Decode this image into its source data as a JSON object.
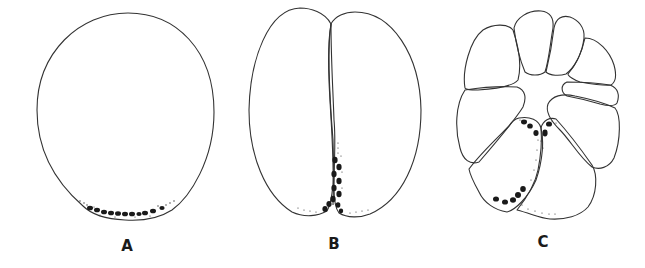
{
  "figure": {
    "panels": [
      {
        "id": "A",
        "label": "A",
        "stage": "uncleaved egg",
        "label_pos": {
          "x": 127,
          "y": 239
        }
      },
      {
        "id": "B",
        "label": "B",
        "stage": "two-cell stage",
        "label_pos": {
          "x": 334,
          "y": 237
        }
      },
      {
        "id": "C",
        "label": "C",
        "stage": "multicellular cleavage stage",
        "label_pos": {
          "x": 543,
          "y": 235
        }
      }
    ],
    "colors": {
      "background": "#ffffff",
      "outline": "#333333",
      "granules": "#1a1a1a"
    }
  }
}
